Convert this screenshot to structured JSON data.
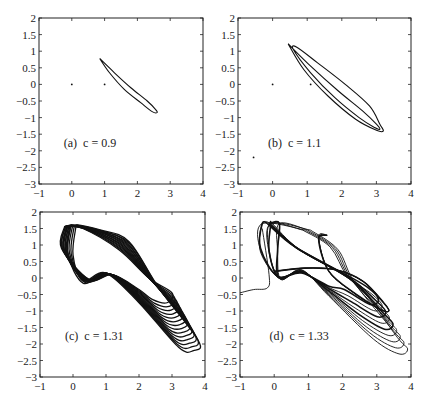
{
  "figure": {
    "width": 423,
    "height": 405,
    "ink_color": "#111111",
    "background": "#ffffff"
  },
  "chart_data": [
    {
      "type": "line",
      "panel": "a",
      "label": "(a)  c = 0.9",
      "parameter_c": 0.9,
      "xlim": [
        -1,
        4
      ],
      "ylim": [
        -3,
        2
      ],
      "xticks": [
        -1,
        0,
        1,
        2,
        3,
        4
      ],
      "yticks": [
        2,
        1.5,
        1,
        0.5,
        0,
        -0.5,
        -1,
        -1.5,
        -2,
        -2.5,
        -3
      ],
      "xtick_labels": [
        "−1",
        "0",
        "1",
        "2",
        "3",
        "4"
      ],
      "ytick_labels": [
        "2",
        "1.5",
        "1",
        "0.5",
        "0",
        "−0.5",
        "−1",
        "−1.5",
        "−2",
        "−2.5",
        "−3"
      ],
      "grid": false,
      "description": "Period-1 limit cycle: a single thin elongated loop",
      "fixed_points": [
        [
          0,
          0
        ],
        [
          1,
          0
        ]
      ],
      "series": [
        {
          "name": "orbit",
          "loops": 1,
          "points": [
            [
              0.85,
              0.78
            ],
            [
              1.3,
              0.35
            ],
            [
              1.8,
              -0.1
            ],
            [
              2.3,
              -0.5
            ],
            [
              2.55,
              -0.75
            ],
            [
              2.6,
              -0.85
            ],
            [
              2.45,
              -0.82
            ],
            [
              2.1,
              -0.55
            ],
            [
              1.6,
              -0.15
            ],
            [
              1.15,
              0.35
            ],
            [
              0.85,
              0.78
            ]
          ]
        }
      ]
    },
    {
      "type": "line",
      "panel": "b",
      "label": "(b)  c = 1.1",
      "parameter_c": 1.1,
      "xlim": [
        -1,
        4
      ],
      "ylim": [
        -3,
        2
      ],
      "xticks": [
        -1,
        0,
        1,
        2,
        3,
        4
      ],
      "yticks": [
        2,
        1.5,
        1,
        0.5,
        0,
        -0.5,
        -1,
        -1.5,
        -2,
        -2.5,
        -3
      ],
      "xtick_labels": [
        "−1",
        "0",
        "1",
        "2",
        "3",
        "4"
      ],
      "ytick_labels": [
        "2",
        "1.5",
        "1",
        "0.5",
        "0",
        "−0.5",
        "−1",
        "−1.5",
        "−2",
        "−2.5",
        "−3"
      ],
      "grid": false,
      "description": "Period-2 limit cycle: a double loop",
      "fixed_points": [
        [
          0,
          0
        ],
        [
          1.1,
          0
        ],
        [
          -0.55,
          -2.2
        ]
      ],
      "series": [
        {
          "name": "orbit",
          "loops": 2,
          "points": [
            [
              0.45,
              1.22
            ],
            [
              1.1,
              0.55
            ],
            [
              1.9,
              -0.2
            ],
            [
              2.6,
              -0.8
            ],
            [
              3.0,
              -1.2
            ],
            [
              3.1,
              -1.35
            ],
            [
              2.95,
              -1.3
            ],
            [
              2.5,
              -1.0
            ],
            [
              1.8,
              -0.4
            ],
            [
              1.1,
              0.35
            ],
            [
              0.6,
              1.05
            ],
            [
              0.7,
              1.12
            ],
            [
              1.3,
              0.65
            ],
            [
              2.1,
              0.0
            ],
            [
              2.8,
              -0.65
            ],
            [
              3.1,
              -1.2
            ],
            [
              3.2,
              -1.4
            ],
            [
              3.0,
              -1.38
            ],
            [
              2.4,
              -1.05
            ],
            [
              1.6,
              -0.35
            ],
            [
              0.9,
              0.45
            ],
            [
              0.45,
              1.22
            ]
          ]
        }
      ]
    },
    {
      "type": "line",
      "panel": "c",
      "label": "(c)  c = 1.31",
      "parameter_c": 1.31,
      "xlim": [
        -1,
        4
      ],
      "ylim": [
        -3,
        2
      ],
      "xticks": [
        -1,
        0,
        1,
        2,
        3,
        4
      ],
      "yticks": [
        2,
        1.5,
        1,
        0.5,
        0,
        -0.5,
        -1,
        -1.5,
        -2,
        -2.5,
        -3
      ],
      "xtick_labels": [
        "−1",
        "0",
        "1",
        "2",
        "3",
        "4"
      ],
      "ytick_labels": [
        "2",
        "1.5",
        "1",
        "0.5",
        "0",
        "−0.5",
        "−1",
        "−1.5",
        "−2",
        "−2.5",
        "−3"
      ],
      "grid": false,
      "description": "Dense chaotic attractor; x spans about -0.3 to 3.8, y about -2.2 to 1.65",
      "bounds": {
        "x": [
          -0.3,
          3.8
        ],
        "y": [
          -2.2,
          1.65
        ]
      },
      "series": [
        {
          "name": "chaotic orbit",
          "loops": 14
        }
      ]
    },
    {
      "type": "line",
      "panel": "d",
      "label": "(d)  c = 1.33",
      "parameter_c": 1.33,
      "xlim": [
        -1,
        4
      ],
      "ylim": [
        -3,
        2
      ],
      "xticks": [
        -1,
        0,
        1,
        2,
        3,
        4
      ],
      "yticks": [
        2,
        1.5,
        1,
        0.5,
        0,
        -0.5,
        -1,
        -1.5,
        -2,
        -2.5,
        -3
      ],
      "xtick_labels": [
        "−1",
        "0",
        "1",
        "2",
        "3",
        "4"
      ],
      "ytick_labels": [
        "2",
        "1.5",
        "1",
        "0.5",
        "0",
        "−0.5",
        "−1",
        "−1.5",
        "−2",
        "−2.5",
        "−3"
      ],
      "grid": false,
      "description": "Chaotic attractor with fewer dense bands and a transient tail entering from the left edge near y = -0.5",
      "bounds": {
        "x": [
          -1.0,
          3.9
        ],
        "y": [
          -2.3,
          1.7
        ]
      },
      "transient": [
        [
          -1.0,
          -0.45
        ],
        [
          -0.6,
          -0.35
        ],
        [
          -0.2,
          -0.3
        ],
        [
          -0.15,
          0.1
        ],
        [
          -0.35,
          1.5
        ]
      ],
      "series": [
        {
          "name": "chaotic orbit",
          "loops": 9
        }
      ]
    }
  ]
}
